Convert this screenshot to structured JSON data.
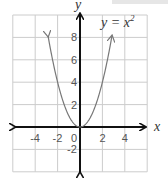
{
  "chart_data": {
    "type": "line",
    "equation_label": "y = x",
    "equation_exponent": "2",
    "xlabel": "x",
    "ylabel": "y",
    "xlim": [
      -6,
      6
    ],
    "ylim": [
      -4,
      10
    ],
    "grid": true,
    "grid_step": 2,
    "x_ticks": [
      -4,
      -2,
      0,
      2,
      4
    ],
    "x_tick_labels": [
      "-4",
      "-2",
      "0",
      "2",
      "4"
    ],
    "y_ticks": [
      8,
      6,
      4,
      2,
      -2
    ],
    "y_tick_labels": [
      "8",
      "6",
      "4",
      "2",
      "-2"
    ],
    "series": [
      {
        "name": "y = x^2",
        "x": [
          -3,
          -2.5,
          -2,
          -1.5,
          -1,
          -0.5,
          0,
          0.5,
          1,
          1.5,
          2,
          2.5,
          3
        ],
        "values": [
          9,
          6.25,
          4,
          2.25,
          1,
          0.25,
          0,
          0.25,
          1,
          2.25,
          4,
          6.25,
          9
        ],
        "color": "#777777",
        "arrows_at_ends": true
      }
    ],
    "axis_color": "#111111",
    "grid_color": "#cccccc"
  }
}
